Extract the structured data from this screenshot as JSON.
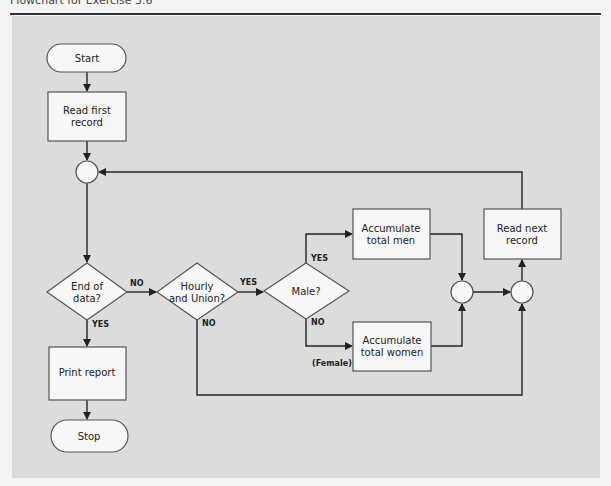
{
  "page": {
    "title": "Flowchart for Exercise 3.6"
  },
  "colors": {
    "panel_bg": "#dcdcdc",
    "node_fill": "#f7f7f7",
    "node_stroke": "#555555",
    "line": "#222222"
  },
  "nodes": {
    "start": {
      "type": "terminator",
      "text": "Start"
    },
    "read_first": {
      "type": "process",
      "line1": "Read first",
      "line2": "record"
    },
    "connector_top": {
      "type": "connector"
    },
    "end_of_data": {
      "type": "decision",
      "line1": "End of",
      "line2": "data?"
    },
    "hourly_union": {
      "type": "decision",
      "line1": "Hourly",
      "line2": "and Union?"
    },
    "male": {
      "type": "decision",
      "text": "Male?"
    },
    "acc_men": {
      "type": "process",
      "line1": "Accumulate",
      "line2": "total men"
    },
    "acc_women": {
      "type": "process",
      "line1": "Accumulate",
      "line2": "total women"
    },
    "connector_merge_gender": {
      "type": "connector"
    },
    "connector_merge_all": {
      "type": "connector"
    },
    "read_next": {
      "type": "process",
      "line1": "Read next",
      "line2": "record"
    },
    "print_report": {
      "type": "process",
      "text": "Print report"
    },
    "stop": {
      "type": "terminator",
      "text": "Stop"
    }
  },
  "edge_labels": {
    "end_no": "NO",
    "end_yes": "YES",
    "hourly_yes": "YES",
    "hourly_no": "NO",
    "male_yes": "YES",
    "male_no": "NO",
    "female_note": "(Female)"
  }
}
